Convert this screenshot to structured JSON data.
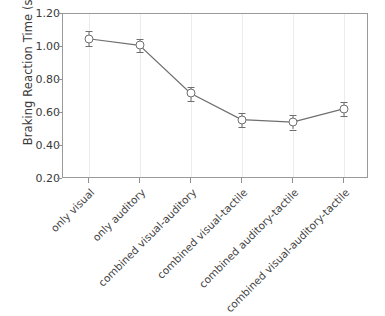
{
  "chart_data": {
    "type": "line",
    "title": "",
    "xlabel": "",
    "ylabel": "Braking Reaction Time (s)",
    "categories": [
      "only visual",
      "only auditory",
      "combined visual-auditory",
      "combined visual-tactile",
      "combined auditory-tactile",
      "combined visual-auditory-tactile"
    ],
    "values": [
      1.05,
      1.01,
      0.72,
      0.56,
      0.545,
      0.625
    ],
    "error_low": [
      0.045,
      0.04,
      0.05,
      0.045,
      0.045,
      0.045
    ],
    "error_high": [
      0.045,
      0.04,
      0.04,
      0.04,
      0.04,
      0.04
    ],
    "ylim": [
      0.2,
      1.2
    ],
    "yticks": [
      0.2,
      0.4,
      0.6,
      0.8,
      1.0,
      1.2
    ],
    "ytick_labels": [
      "0.20",
      "0.40",
      "0.60",
      "0.80",
      "1.00",
      "1.20"
    ],
    "grid": "vertical-only",
    "legend": null,
    "marker": "open-circle",
    "errorbar_style": "capped",
    "line_color": "#6f6f6f",
    "marker_face_color": "#ffffff",
    "marker_edge_color": "#6f6f6f",
    "grid_color": "#ececec",
    "axis_color": "#9a9a9a",
    "text_color": "#3a3a3a",
    "background": "#ffffff"
  }
}
